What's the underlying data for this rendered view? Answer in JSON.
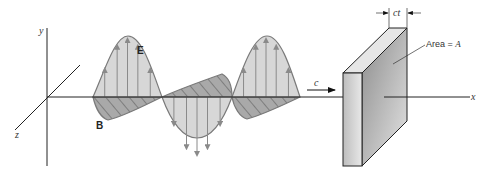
{
  "diagram": {
    "axes": {
      "x": "x",
      "y": "y",
      "z": "z"
    },
    "fields": {
      "electric": "E",
      "magnetic": "B"
    },
    "speed_label": "c",
    "thickness_label": "ct",
    "area_label_prefix": "Area = ",
    "area_label_symbol": "A",
    "colors": {
      "e_fill": "#d4d4d4",
      "b_fill": "#a9a9a9",
      "outline": "#7a7a7a",
      "arrow": "#8a8a8a",
      "axis": "#222222"
    }
  }
}
